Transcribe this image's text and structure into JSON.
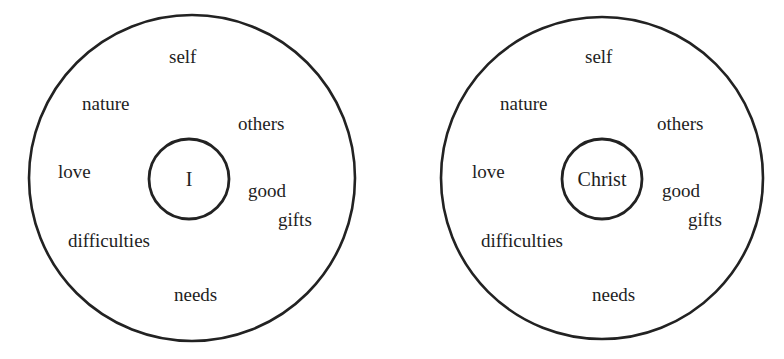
{
  "diagrams": [
    {
      "center_label": "I",
      "labels": {
        "self": "self",
        "nature": "nature",
        "others": "others",
        "love": "love",
        "good": "good",
        "gifts": "gifts",
        "difficulties": "difficulties",
        "needs": "needs"
      }
    },
    {
      "center_label": "Christ",
      "labels": {
        "self": "self",
        "nature": "nature",
        "others": "others",
        "love": "love",
        "good": "good",
        "gifts": "gifts",
        "difficulties": "difficulties",
        "needs": "needs"
      }
    }
  ],
  "colors": {
    "stroke": "#222222",
    "text": "#1e1e1e",
    "background": "#ffffff"
  }
}
